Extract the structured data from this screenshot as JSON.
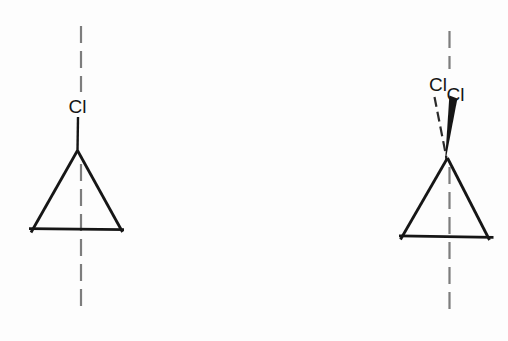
{
  "figure": {
    "colors": {
      "background": "#fdfdfd",
      "bond": "#161616",
      "axis_dash": "#7d7d7d",
      "dashed_bond": "#2b2b2b"
    },
    "left_structure": {
      "substituent_label": "Cl"
    },
    "right_structure": {
      "back_substituent_label": "Cl",
      "front_substituent_label": "Cl"
    }
  }
}
